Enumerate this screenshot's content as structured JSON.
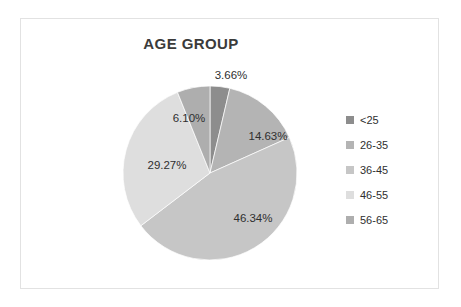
{
  "chart_data": {
    "type": "pie",
    "title": "AGE GROUP",
    "categories": [
      "<25",
      "26-35",
      "36-45",
      "46-55",
      "56-65"
    ],
    "values": [
      3.66,
      14.63,
      46.34,
      29.27,
      6.1
    ],
    "value_labels": [
      "3.66%",
      "14.63%",
      "46.34%",
      "29.27%",
      "6.10%"
    ],
    "unit": "%",
    "legend_position": "right",
    "start_angle_deg": 0,
    "direction": "clockwise",
    "colors": [
      "#8d8d8d",
      "#b4b4b4",
      "#c6c6c6",
      "#dedede",
      "#aeaeae"
    ],
    "label_positions": [
      {
        "label": "3.66%",
        "x": 210,
        "y": 57
      },
      {
        "label": "14.63%",
        "x": 247,
        "y": 118
      },
      {
        "label": "46.34%",
        "x": 232,
        "y": 200
      },
      {
        "label": "29.27%",
        "x": 146,
        "y": 147
      },
      {
        "label": "6.10%",
        "x": 168,
        "y": 100
      }
    ],
    "geometry": {
      "cx": 189,
      "cy": 154,
      "r": 87
    }
  },
  "legend": {
    "items": [
      {
        "label": "<25",
        "color": "#8d8d8d"
      },
      {
        "label": "26-35",
        "color": "#b4b4b4"
      },
      {
        "label": "36-45",
        "color": "#c6c6c6"
      },
      {
        "label": "46-55",
        "color": "#dedede"
      },
      {
        "label": "56-65",
        "color": "#aeaeae"
      }
    ]
  },
  "frame": {
    "border_color": "#e2e2e2",
    "background": "#ffffff"
  }
}
